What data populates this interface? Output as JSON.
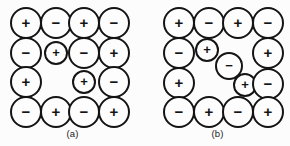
{
  "figure": {
    "background_color": "#fcfcfc",
    "outline_color": "#141414",
    "fill_color": "#fdfdfd",
    "width": 290,
    "height": 146
  },
  "panels": [
    {
      "id": "a",
      "label": "(a)",
      "label_x": 70,
      "label_y": 128,
      "ions": [
        {
          "sign": "+",
          "cx": 26,
          "cy": 23,
          "r": 16
        },
        {
          "sign": "−",
          "cx": 56,
          "cy": 23,
          "r": 16
        },
        {
          "sign": "+",
          "cx": 84,
          "cy": 23,
          "r": 16
        },
        {
          "sign": "−",
          "cx": 114,
          "cy": 23,
          "r": 16
        },
        {
          "sign": "−",
          "cx": 26,
          "cy": 53,
          "r": 16
        },
        {
          "sign": "+",
          "cx": 56,
          "cy": 53,
          "r": 12
        },
        {
          "sign": "−",
          "cx": 84,
          "cy": 53,
          "r": 16
        },
        {
          "sign": "+",
          "cx": 114,
          "cy": 53,
          "r": 16
        },
        {
          "sign": "+",
          "cx": 26,
          "cy": 82,
          "r": 16
        },
        {
          "sign": "+",
          "cx": 84,
          "cy": 82,
          "r": 12
        },
        {
          "sign": "−",
          "cx": 114,
          "cy": 82,
          "r": 16
        },
        {
          "sign": "−",
          "cx": 26,
          "cy": 112,
          "r": 16
        },
        {
          "sign": "+",
          "cx": 56,
          "cy": 112,
          "r": 16
        },
        {
          "sign": "−",
          "cx": 84,
          "cy": 112,
          "r": 16
        },
        {
          "sign": "+",
          "cx": 114,
          "cy": 112,
          "r": 16
        }
      ]
    },
    {
      "id": "b",
      "label": "(b)",
      "label_x": 80,
      "label_y": 128,
      "ions": [
        {
          "sign": "+",
          "cx": 34,
          "cy": 23,
          "r": 16
        },
        {
          "sign": "−",
          "cx": 64,
          "cy": 23,
          "r": 16
        },
        {
          "sign": "+",
          "cx": 93,
          "cy": 23,
          "r": 16
        },
        {
          "sign": "−",
          "cx": 123,
          "cy": 23,
          "r": 16
        },
        {
          "sign": "−",
          "cx": 34,
          "cy": 53,
          "r": 16
        },
        {
          "sign": "+",
          "cx": 62,
          "cy": 50,
          "r": 12
        },
        {
          "sign": "−",
          "cx": 84,
          "cy": 66,
          "r": 14
        },
        {
          "sign": "+",
          "cx": 123,
          "cy": 53,
          "r": 16
        },
        {
          "sign": "+",
          "cx": 34,
          "cy": 83,
          "r": 16
        },
        {
          "sign": "+",
          "cx": 100,
          "cy": 85,
          "r": 12
        },
        {
          "sign": "−",
          "cx": 123,
          "cy": 84,
          "r": 16
        },
        {
          "sign": "−",
          "cx": 34,
          "cy": 112,
          "r": 16
        },
        {
          "sign": "+",
          "cx": 64,
          "cy": 112,
          "r": 16
        },
        {
          "sign": "−",
          "cx": 93,
          "cy": 112,
          "r": 16
        },
        {
          "sign": "+",
          "cx": 123,
          "cy": 112,
          "r": 16
        }
      ]
    }
  ]
}
